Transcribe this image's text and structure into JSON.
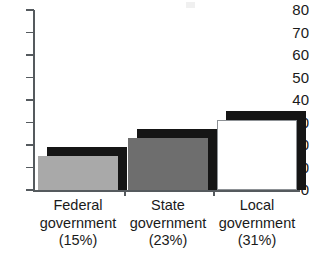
{
  "chart_data": {
    "type": "bar",
    "title": "",
    "subtitle": "",
    "xlabel": "",
    "ylabel": "",
    "ylim": [
      0,
      80
    ],
    "ytick_step": 10,
    "yticks": [
      "80",
      "70",
      "60",
      "50",
      "40",
      "30",
      "20",
      "10",
      "0"
    ],
    "grid": false,
    "legend": "none",
    "orientation": "vertical",
    "style": "3d-shadow-bars",
    "categories": [
      "Federal government",
      "State government",
      "Local government"
    ],
    "category_lines": [
      [
        "Federal",
        "government",
        "(15%)"
      ],
      [
        "State",
        "government",
        "(23%)"
      ],
      [
        "Local",
        "government",
        "(31%)"
      ]
    ],
    "values": [
      15,
      23,
      31
    ],
    "value_labels": [
      "15%",
      "23%",
      "31%"
    ],
    "series": [
      {
        "name": "Percent",
        "values": [
          15,
          23,
          31
        ]
      }
    ],
    "bar_colors": [
      "#a9a9a9",
      "#6e6e6e",
      "#ffffff"
    ],
    "bar_outline_colors": [
      "none",
      "none",
      "#8d9195"
    ],
    "shadow_color": "#151515",
    "axis_color": "#555a5e"
  },
  "axis": {
    "y_tick_labels": [
      {
        "value": "80"
      },
      {
        "value": "70"
      },
      {
        "value": "60"
      },
      {
        "value": "50"
      },
      {
        "value": "40"
      },
      {
        "value": "30"
      },
      {
        "value": "20"
      },
      {
        "value": "10"
      },
      {
        "value": "0"
      }
    ]
  },
  "categories": [
    {
      "line1": "Federal",
      "line2": "government",
      "line3": "(15%)"
    },
    {
      "line1": "State",
      "line2": "government",
      "line3": "(23%)"
    },
    {
      "line1": "Local",
      "line2": "government",
      "line3": "(31%)"
    }
  ]
}
